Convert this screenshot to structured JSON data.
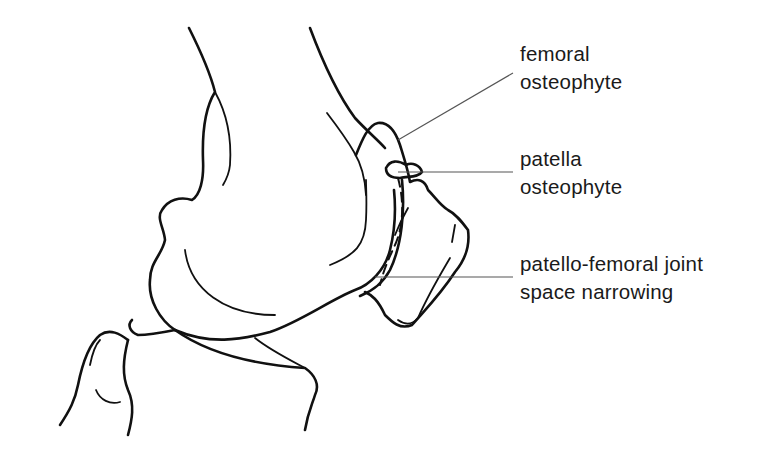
{
  "diagram": {
    "line_color": "#111111",
    "leader_color": "#555555",
    "background": "#ffffff"
  },
  "labels": [
    {
      "id": "femoral-osteophyte",
      "line1": "femoral",
      "line2": "osteophyte"
    },
    {
      "id": "patella-osteophyte",
      "line1": "patella",
      "line2": "osteophyte"
    },
    {
      "id": "joint-space-narrowing",
      "line1": "patello-femoral joint",
      "line2": "space narrowing"
    }
  ]
}
